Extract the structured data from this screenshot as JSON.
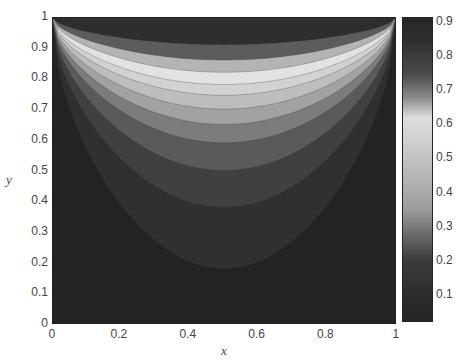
{
  "chart_data": {
    "type": "heatmap",
    "subtype": "filled-contour",
    "title": "",
    "xlabel": "x",
    "ylabel": "y",
    "xlim": [
      0,
      1
    ],
    "ylim": [
      0,
      1
    ],
    "x_ticks": [
      "0",
      "0.2",
      "0.4",
      "0.6",
      "0.8",
      "1"
    ],
    "y_ticks": [
      "0",
      "0.1",
      "0.2",
      "0.3",
      "0.4",
      "0.5",
      "0.6",
      "0.7",
      "0.8",
      "0.9",
      "1"
    ],
    "grid": false,
    "symmetry": "symmetric about x = 0.5; maximum along top edge y = 1, minimum along bottom and side walls",
    "contour_levels": [
      0.1,
      0.2,
      0.3,
      0.4,
      0.5,
      0.6,
      0.65,
      0.7,
      0.75,
      0.8,
      0.85
    ],
    "centerline_level_depths": [
      {
        "level": 0.1,
        "y_at_x_0.5": 0.18
      },
      {
        "level": 0.2,
        "y_at_x_0.5": 0.38
      },
      {
        "level": 0.3,
        "y_at_x_0.5": 0.5
      },
      {
        "level": 0.4,
        "y_at_x_0.5": 0.59
      },
      {
        "level": 0.5,
        "y_at_x_0.5": 0.65
      },
      {
        "level": 0.6,
        "y_at_x_0.5": 0.7
      },
      {
        "level": 0.65,
        "y_at_x_0.5": 0.745
      },
      {
        "level": 0.7,
        "y_at_x_0.5": 0.78
      },
      {
        "level": 0.75,
        "y_at_x_0.5": 0.82
      },
      {
        "level": 0.8,
        "y_at_x_0.5": 0.86
      },
      {
        "level": 0.85,
        "y_at_x_0.5": 0.91
      }
    ],
    "band_colors": [
      "#232323",
      "#303030",
      "#404040",
      "#5a5a5a",
      "#7c7c7c",
      "#a2a2a2",
      "#bdbdbd",
      "#d2d2d2",
      "#e2e2e2",
      "#b4b4b4",
      "#5c5c5c",
      "#2e2e2e"
    ],
    "colorbar": {
      "range": [
        0.02,
        0.915
      ],
      "ticks": [
        "0.1",
        "0.2",
        "0.3",
        "0.4",
        "0.5",
        "0.6",
        "0.7",
        "0.8",
        "0.9"
      ],
      "stops": [
        {
          "v": 0.02,
          "color": "#262626"
        },
        {
          "v": 0.1,
          "color": "#2c2c2c"
        },
        {
          "v": 0.2,
          "color": "#3c3c3c"
        },
        {
          "v": 0.28,
          "color": "#6e6e6e"
        },
        {
          "v": 0.35,
          "color": "#9c9c9c"
        },
        {
          "v": 0.45,
          "color": "#b6b6b6"
        },
        {
          "v": 0.55,
          "color": "#cfcfcf"
        },
        {
          "v": 0.62,
          "color": "#dedede"
        },
        {
          "v": 0.68,
          "color": "#8a8a8a"
        },
        {
          "v": 0.75,
          "color": "#4a4a4a"
        },
        {
          "v": 0.85,
          "color": "#2e2e2e"
        },
        {
          "v": 0.915,
          "color": "#262626"
        }
      ]
    }
  },
  "labels": {
    "x_axis_title": "x",
    "y_axis_title": "y"
  }
}
